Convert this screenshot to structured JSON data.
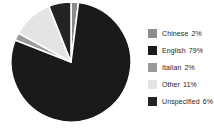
{
  "chart_data": {
    "type": "pie",
    "title": "",
    "subtitle": "",
    "xlabel": "",
    "ylabel": "",
    "legend_position": "right",
    "grid": false,
    "start_angle_deg": 0,
    "direction": "clockwise",
    "categories": [
      "Chinese",
      "English",
      "Italian",
      "Other",
      "Unspecified"
    ],
    "values": [
      2,
      79,
      2,
      11,
      6
    ],
    "value_unit": "%",
    "slices": [
      {
        "label": "Chinese",
        "value": 2,
        "value_text": "2%",
        "color": "#8c8c8c"
      },
      {
        "label": "English",
        "value": 79,
        "value_text": "79%",
        "color": "#1a1a1a"
      },
      {
        "label": "Italian",
        "value": 2,
        "value_text": "2%",
        "color": "#9a9a9a"
      },
      {
        "label": "Other",
        "value": 11,
        "value_text": "11%",
        "color": "#e4e4e4"
      },
      {
        "label": "Unspecified",
        "value": 6,
        "value_text": "6%",
        "color": "#232323"
      }
    ],
    "colors": [
      "#8c8c8c",
      "#1a1a1a",
      "#9a9a9a",
      "#e4e4e4",
      "#232323"
    ],
    "background_color": "#ffffff",
    "slice_border_color": "#ffffff"
  },
  "legend": {
    "items": [
      {
        "label": "Chinese",
        "value_text": "2%"
      },
      {
        "label": "English",
        "value_text": "79%"
      },
      {
        "label": "Italian",
        "value_text": "2%"
      },
      {
        "label": "Other",
        "value_text": "11%"
      },
      {
        "label": "Unspecified",
        "value_text": "6%"
      }
    ]
  }
}
